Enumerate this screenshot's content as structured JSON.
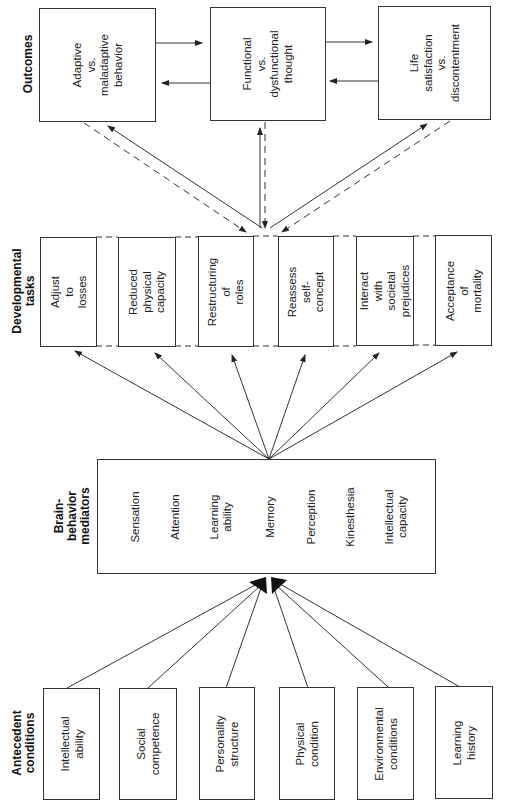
{
  "diagram": {
    "orientation": "rotated-90-ccw",
    "sections": {
      "outcomes": {
        "label": [
          "Outcomes"
        ]
      },
      "developmental_tasks": {
        "label": [
          "Developmental",
          "tasks"
        ]
      },
      "mediators": {
        "label": [
          "Brain-",
          "behavior",
          "mediators"
        ]
      },
      "antecedents": {
        "label": [
          "Antecedent",
          "conditions"
        ]
      }
    },
    "outcomes": [
      {
        "lines": [
          "Adaptive",
          "vs.",
          "maladaptive",
          "behavior"
        ]
      },
      {
        "lines": [
          "Functional",
          "vs.",
          "dysfunctional",
          "thought"
        ]
      },
      {
        "lines": [
          "Life",
          "satisfaction",
          "vs.",
          "discontentment"
        ]
      }
    ],
    "developmental_tasks": [
      {
        "lines": [
          "Adjust",
          "to",
          "losses"
        ]
      },
      {
        "lines": [
          "Reduced",
          "physical",
          "capacity"
        ]
      },
      {
        "lines": [
          "Restructuring",
          "of",
          "roles"
        ]
      },
      {
        "lines": [
          "Reassess",
          "self-",
          "concept"
        ]
      },
      {
        "lines": [
          "Interact",
          "with",
          "societal",
          "prejudices"
        ]
      },
      {
        "lines": [
          "Acceptance",
          "of",
          "mortality"
        ]
      }
    ],
    "mediators": [
      {
        "lines": [
          "Sensation"
        ]
      },
      {
        "lines": [
          "Attention"
        ]
      },
      {
        "lines": [
          "Learning",
          "ability"
        ]
      },
      {
        "lines": [
          "Memory"
        ]
      },
      {
        "lines": [
          "Perception"
        ]
      },
      {
        "lines": [
          "Kinesthesia"
        ]
      },
      {
        "lines": [
          "Intellectual",
          "capacity"
        ]
      }
    ],
    "antecedents": [
      {
        "lines": [
          "Intellectual",
          "ability"
        ]
      },
      {
        "lines": [
          "Social",
          "competence"
        ]
      },
      {
        "lines": [
          "Personality",
          "structure"
        ]
      },
      {
        "lines": [
          "Physical",
          "condition"
        ]
      },
      {
        "lines": [
          "Environmental",
          "conditions"
        ]
      },
      {
        "lines": [
          "Learning",
          "history"
        ]
      }
    ],
    "colors": {
      "line": "#333333",
      "text": "#222222",
      "background": "#ffffff"
    }
  }
}
